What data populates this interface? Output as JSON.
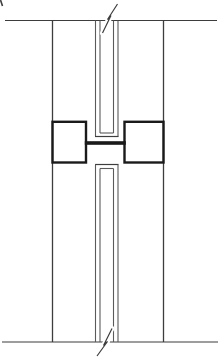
{
  "canvas": {
    "width": 222,
    "height": 359,
    "background": "#ffffff"
  },
  "colors": {
    "thin_line": "#3d3d3d",
    "channel_line": "#5a5a5a",
    "bold_line": "#1a1a1a",
    "background": "#ffffff"
  },
  "drawing": {
    "description": "Black-and-white sectional detail drawing: two vertical panels meeting at a central joint channel joined by a bold H-shaped connector profile, with break-line marks at top and bottom",
    "thin_lines": [
      {
        "name": "top-edge-line",
        "x1": 5,
        "y1": 20.5,
        "x2": 217,
        "y2": 20.5,
        "w": 1.1,
        "color": "thin_line"
      },
      {
        "name": "bottom-edge-line",
        "x1": 2,
        "y1": 342,
        "x2": 218,
        "y2": 342,
        "w": 1.1,
        "color": "thin_line"
      },
      {
        "name": "left-wall-line",
        "x1": 52.5,
        "y1": 20.5,
        "x2": 52.5,
        "y2": 342,
        "w": 1.3,
        "color": "thin_line"
      },
      {
        "name": "right-wall-line",
        "x1": 163.5,
        "y1": 20.5,
        "x2": 163.5,
        "y2": 342,
        "w": 1.3,
        "color": "thin_line"
      },
      {
        "name": "channel-outer-left-top",
        "x1": 95.5,
        "y1": 20.5,
        "x2": 95.5,
        "y2": 136.5,
        "w": 1.1,
        "color": "channel_line"
      },
      {
        "name": "channel-inner-left-top",
        "x1": 100,
        "y1": 20.5,
        "x2": 100,
        "y2": 133,
        "w": 1.1,
        "color": "channel_line"
      },
      {
        "name": "channel-inner-right-top",
        "x1": 113.5,
        "y1": 20.5,
        "x2": 113.5,
        "y2": 133,
        "w": 1.1,
        "color": "channel_line"
      },
      {
        "name": "channel-outer-right-top",
        "x1": 118,
        "y1": 20.5,
        "x2": 118,
        "y2": 136.5,
        "w": 1.1,
        "color": "channel_line"
      },
      {
        "name": "channel-inner-cap-top",
        "x1": 100,
        "y1": 133,
        "x2": 113.5,
        "y2": 133,
        "w": 1.1,
        "color": "channel_line"
      },
      {
        "name": "channel-outer-cap-top",
        "x1": 95,
        "y1": 136.5,
        "x2": 118.5,
        "y2": 136.5,
        "w": 1.2,
        "color": "thin_line"
      },
      {
        "name": "channel-outer-cap-bottom",
        "x1": 95,
        "y1": 164.5,
        "x2": 118.5,
        "y2": 164.5,
        "w": 1.2,
        "color": "thin_line"
      },
      {
        "name": "channel-inner-cap-bottom",
        "x1": 100,
        "y1": 168.5,
        "x2": 113.5,
        "y2": 168.5,
        "w": 1.1,
        "color": "channel_line"
      },
      {
        "name": "channel-outer-left-bottom",
        "x1": 95.5,
        "y1": 164.5,
        "x2": 95.5,
        "y2": 342,
        "w": 1.1,
        "color": "channel_line"
      },
      {
        "name": "channel-inner-left-bottom",
        "x1": 100,
        "y1": 168.5,
        "x2": 100,
        "y2": 342,
        "w": 1.1,
        "color": "channel_line"
      },
      {
        "name": "channel-inner-right-bottom",
        "x1": 113.5,
        "y1": 168.5,
        "x2": 113.5,
        "y2": 342,
        "w": 1.1,
        "color": "channel_line"
      },
      {
        "name": "channel-outer-right-bottom",
        "x1": 118,
        "y1": 164.5,
        "x2": 118,
        "y2": 342,
        "w": 1.1,
        "color": "channel_line"
      },
      {
        "name": "corner-artifact-mark",
        "x1": 0.5,
        "y1": 0,
        "x2": 2.5,
        "y2": 6,
        "w": 1.6,
        "color": "thin_line"
      }
    ],
    "bold_rects": [
      {
        "name": "left-connector-flange",
        "x": 52.5,
        "y": 121.8,
        "width": 33.5,
        "height": 40.7,
        "w": 2.4
      },
      {
        "name": "right-connector-flange",
        "x": 124.5,
        "y": 121.8,
        "width": 39,
        "height": 40.7,
        "w": 2.4
      }
    ],
    "bold_bars": [
      {
        "name": "connector-web",
        "x": 84.8,
        "y": 141.2,
        "width": 41,
        "height": 3.6
      }
    ],
    "break_marks": [
      {
        "name": "top-break-mark",
        "path": "M102.5,33 L111,15.5 L107.5,19.5 L117.5,4",
        "w": 1.2,
        "halo": 5
      },
      {
        "name": "bottom-break-mark",
        "path": "M112,328.5 L103.5,345.5 L107.5,341.5 L97,356",
        "w": 1.2,
        "halo": 5
      }
    ]
  }
}
